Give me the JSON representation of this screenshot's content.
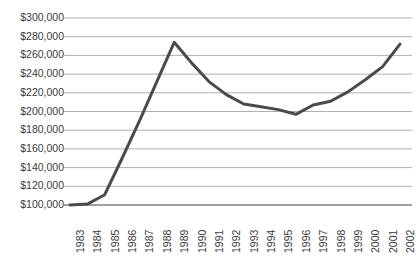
{
  "chart_data": {
    "type": "line",
    "title": "",
    "xlabel": "",
    "ylabel": "",
    "x": [
      1983,
      1984,
      1985,
      1986,
      1987,
      1988,
      1989,
      1990,
      1991,
      1992,
      1993,
      1994,
      1995,
      1996,
      1997,
      1998,
      1999,
      2000,
      2001,
      2002
    ],
    "categories": [
      "1983",
      "1984",
      "1985",
      "1986",
      "1987",
      "1988",
      "1989",
      "1990",
      "1991",
      "1992",
      "1993",
      "1994",
      "1995",
      "1996",
      "1997",
      "1998",
      "1999",
      "2000",
      "2001",
      "2002"
    ],
    "values": [
      100000,
      101000,
      111000,
      150000,
      190000,
      232000,
      274000,
      252000,
      232000,
      218000,
      208000,
      205000,
      202000,
      197000,
      207000,
      211000,
      221000,
      234000,
      248000,
      272000
    ],
    "series": [
      {
        "name": "Value",
        "values": [
          100000,
          101000,
          111000,
          150000,
          190000,
          232000,
          274000,
          252000,
          232000,
          218000,
          208000,
          205000,
          202000,
          197000,
          207000,
          211000,
          221000,
          234000,
          248000,
          272000
        ]
      }
    ],
    "ylim": [
      100000,
      300000
    ],
    "ytick_values": [
      100000,
      120000,
      140000,
      160000,
      180000,
      200000,
      220000,
      240000,
      260000,
      280000,
      300000
    ],
    "ytick_labels": [
      "$100,000",
      "$120,000",
      "$140,000",
      "$160,000",
      "$180,000",
      "$200,000",
      "$220,000",
      "$240,000",
      "$260,000",
      "$280,000",
      "$300,000"
    ],
    "grid": true,
    "grid_axis": "y",
    "legend": false,
    "legend_position": "none",
    "line_color": "#4a4a4a",
    "grid_color": "#b0b0b0",
    "axis_color": "#6b6b6b",
    "text_color": "#3a3a3a",
    "background_color": "#ffffff",
    "line_width": 3
  }
}
